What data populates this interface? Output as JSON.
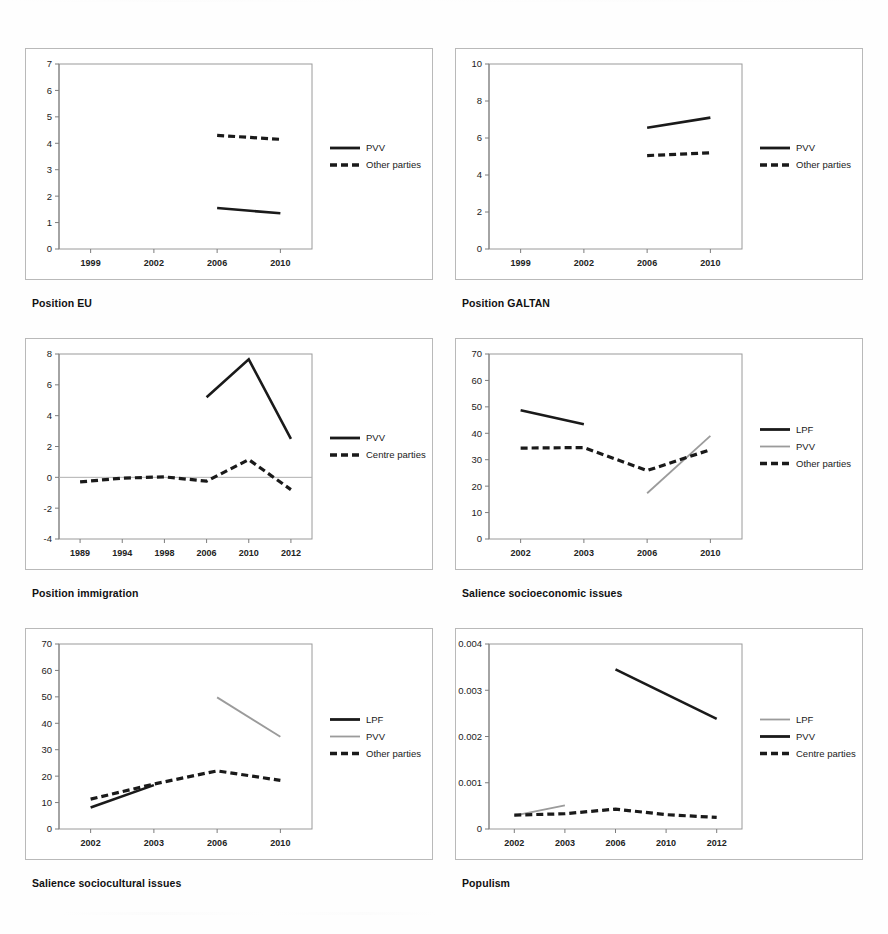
{
  "figure": {
    "panel_count": 6,
    "layout": "2 columns x 3 rows"
  },
  "captions": {
    "c1": "Position EU",
    "c2": "Position GALTAN",
    "c3": "Position immigration",
    "c4": "Salience socioeconomic issues",
    "c5": "Salience sociocultural issues",
    "c6": "Populism"
  },
  "colors": {
    "black": "#1a1a1a",
    "grey": "#9b9b9b",
    "frame": "#9a9a9a",
    "background": "#ffffff"
  },
  "chart_data": [
    {
      "id": "position-eu",
      "type": "line",
      "title": "Position EU",
      "xlabel": "",
      "ylabel": "",
      "x_ticks": [
        "1999",
        "2002",
        "2006",
        "2010"
      ],
      "y_ticks": [
        "0",
        "1",
        "2",
        "3",
        "4",
        "5",
        "6",
        "7"
      ],
      "ylim": [
        0,
        7
      ],
      "grid": false,
      "legend_position": "right",
      "series": [
        {
          "name": "PVV",
          "style": "solid",
          "color": "#1a1a1a",
          "x": [
            "2006",
            "2010"
          ],
          "values": [
            1.55,
            1.35
          ]
        },
        {
          "name": "Other parties",
          "style": "dashed",
          "color": "#1a1a1a",
          "x": [
            "2006",
            "2010"
          ],
          "values": [
            4.3,
            4.15
          ]
        }
      ]
    },
    {
      "id": "position-galtan",
      "type": "line",
      "title": "Position GALTAN",
      "xlabel": "",
      "ylabel": "",
      "x_ticks": [
        "1999",
        "2002",
        "2006",
        "2010"
      ],
      "y_ticks": [
        "0",
        "2",
        "4",
        "6",
        "8",
        "10"
      ],
      "ylim": [
        0,
        10
      ],
      "grid": false,
      "legend_position": "right",
      "series": [
        {
          "name": "PVV",
          "style": "solid",
          "color": "#1a1a1a",
          "x": [
            "2006",
            "2010"
          ],
          "values": [
            6.55,
            7.1
          ]
        },
        {
          "name": "Other parties",
          "style": "dashed",
          "color": "#1a1a1a",
          "x": [
            "2006",
            "2010"
          ],
          "values": [
            5.05,
            5.2
          ]
        }
      ]
    },
    {
      "id": "position-immigration",
      "type": "line",
      "title": "Position immigration",
      "xlabel": "",
      "ylabel": "",
      "x_ticks": [
        "1989",
        "1994",
        "1998",
        "2006",
        "2010",
        "2012"
      ],
      "y_ticks": [
        "-4",
        "-2",
        "0",
        "2",
        "4",
        "6",
        "8"
      ],
      "ylim": [
        -4,
        8
      ],
      "grid": false,
      "legend_position": "right",
      "series": [
        {
          "name": "PVV",
          "style": "solid",
          "color": "#1a1a1a",
          "x": [
            "2006",
            "2010",
            "2012"
          ],
          "values": [
            5.2,
            7.65,
            2.5
          ]
        },
        {
          "name": "Centre parties",
          "style": "dashed",
          "color": "#1a1a1a",
          "x": [
            "1989",
            "1994",
            "1998",
            "2006",
            "2010",
            "2012"
          ],
          "values": [
            -0.3,
            -0.05,
            0.03,
            -0.25,
            1.15,
            -0.8
          ]
        }
      ]
    },
    {
      "id": "salience-socioeconomic",
      "type": "line",
      "title": "Salience socioeconomic issues",
      "xlabel": "",
      "ylabel": "",
      "x_ticks": [
        "2002",
        "2003",
        "2006",
        "2010"
      ],
      "y_ticks": [
        "0",
        "10",
        "20",
        "30",
        "40",
        "50",
        "60",
        "70"
      ],
      "ylim": [
        0,
        70
      ],
      "grid": false,
      "legend_position": "right",
      "series": [
        {
          "name": "LPF",
          "style": "solid",
          "color": "#1a1a1a",
          "x": [
            "2002",
            "2003"
          ],
          "values": [
            48.7,
            43.4
          ]
        },
        {
          "name": "PVV",
          "style": "solid-grey",
          "color": "#9b9b9b",
          "x": [
            "2006",
            "2010"
          ],
          "values": [
            17.3,
            39.0
          ]
        },
        {
          "name": "Other parties",
          "style": "dashed",
          "color": "#1a1a1a",
          "x": [
            "2002",
            "2003",
            "2006",
            "2010"
          ],
          "values": [
            34.4,
            34.6,
            25.9,
            33.8
          ]
        }
      ]
    },
    {
      "id": "salience-sociocultural",
      "type": "line",
      "title": "Salience sociocultural issues",
      "xlabel": "",
      "ylabel": "",
      "x_ticks": [
        "2002",
        "2003",
        "2006",
        "2010"
      ],
      "y_ticks": [
        "0",
        "10",
        "20",
        "30",
        "40",
        "50",
        "60",
        "70"
      ],
      "ylim": [
        0,
        70
      ],
      "grid": false,
      "legend_position": "right",
      "series": [
        {
          "name": "LPF",
          "style": "solid",
          "color": "#1a1a1a",
          "x": [
            "2002",
            "2003"
          ],
          "values": [
            8.1,
            16.6
          ]
        },
        {
          "name": "PVV",
          "style": "solid-grey",
          "color": "#9b9b9b",
          "x": [
            "2006",
            "2010"
          ],
          "values": [
            49.8,
            34.9
          ]
        },
        {
          "name": "Other parties",
          "style": "dashed",
          "color": "#1a1a1a",
          "x": [
            "2002",
            "2003",
            "2006",
            "2010"
          ],
          "values": [
            11.3,
            17.0,
            22.0,
            18.4
          ]
        }
      ]
    },
    {
      "id": "populism",
      "type": "line",
      "title": "Populism",
      "xlabel": "",
      "ylabel": "",
      "x_ticks": [
        "2002",
        "2003",
        "2006",
        "2010",
        "2012"
      ],
      "y_ticks": [
        "0",
        "0.001",
        "0.002",
        "0.003",
        "0.004"
      ],
      "ylim": [
        0,
        0.004
      ],
      "grid": false,
      "legend_position": "right",
      "series": [
        {
          "name": "LPF",
          "style": "solid-grey",
          "color": "#9b9b9b",
          "x": [
            "2002",
            "2003"
          ],
          "values": [
            0.00029,
            0.00051
          ]
        },
        {
          "name": "PVV",
          "style": "solid",
          "color": "#1a1a1a",
          "x": [
            "2006",
            "2012"
          ],
          "values": [
            0.00345,
            0.00238
          ]
        },
        {
          "name": "Centre parties",
          "style": "dashed",
          "color": "#1a1a1a",
          "x": [
            "2002",
            "2003",
            "2006",
            "2010",
            "2012"
          ],
          "values": [
            0.0003,
            0.00033,
            0.00043,
            0.00031,
            0.00025
          ]
        }
      ]
    }
  ]
}
